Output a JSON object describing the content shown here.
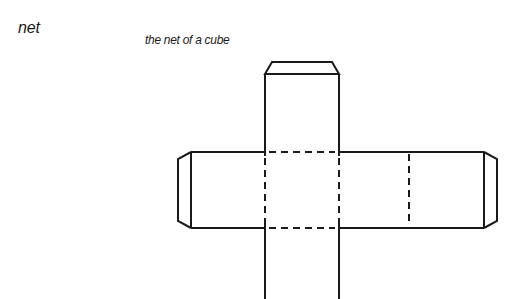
{
  "term": "net",
  "caption": "the net of a cube",
  "diagram": {
    "subject": "net of a cube",
    "faces": 6,
    "flaps": [
      "top",
      "left",
      "right"
    ],
    "colors": {
      "line": "#1a1a1a",
      "background": "#ffffff"
    }
  }
}
